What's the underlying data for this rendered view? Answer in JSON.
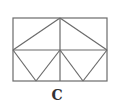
{
  "diagram": {
    "label": "C",
    "stroke_color": "#6b6b6b",
    "rectangle": {
      "x": 13,
      "y": 18,
      "width": 94,
      "height": 63
    },
    "points": {
      "top_left": [
        13,
        18
      ],
      "top_mid": [
        60,
        18
      ],
      "top_right": [
        107,
        18
      ],
      "mid_left": [
        13,
        50
      ],
      "center": [
        60,
        50
      ],
      "mid_right": [
        107,
        50
      ],
      "bottom_left": [
        13,
        81
      ],
      "bottom_v1": [
        36,
        81
      ],
      "bottom_mid": [
        60,
        81
      ],
      "bottom_v2": [
        83,
        81
      ],
      "bottom_right": [
        107,
        81
      ]
    },
    "segments": [
      {
        "name": "horizontal-midline",
        "from": "mid_left",
        "to": "mid_right"
      },
      {
        "name": "vertical-centerline",
        "from": "top_mid",
        "to": "bottom_mid"
      },
      {
        "name": "top-triangle-left",
        "from": "mid_left",
        "to": "top_mid"
      },
      {
        "name": "top-triangle-right",
        "from": "top_mid",
        "to": "mid_right"
      },
      {
        "name": "left-v-left",
        "from": "mid_left",
        "to": "bottom_v1"
      },
      {
        "name": "left-v-right",
        "from": "bottom_v1",
        "to": "center"
      },
      {
        "name": "right-v-left",
        "from": "center",
        "to": "bottom_v2"
      },
      {
        "name": "right-v-right",
        "from": "bottom_v2",
        "to": "mid_right"
      }
    ]
  }
}
